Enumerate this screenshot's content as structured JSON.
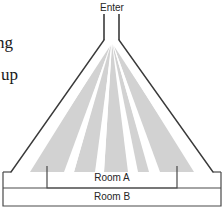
{
  "figure": {
    "type": "evacuation-flow-diagram"
  },
  "labels": {
    "enter": "Enter",
    "room_a": "Room A",
    "room_b": "Room B"
  },
  "body_text": {
    "fragment_1": "ng",
    "fragment_2": "up"
  },
  "colors": {
    "flow_region_fill": "#d2d2d2",
    "wall_line": "#3a3a3a",
    "room_line": "#4a4a4a",
    "path_fill": "#ffffff",
    "text": "#262626",
    "background": "#ffffff"
  },
  "geometry": {
    "apex": {
      "x": 112,
      "y": 40
    },
    "entrance_channel": {
      "left_x": 104,
      "right_x": 119,
      "top_y": 14,
      "bottom_y": 40
    },
    "funnel_left_base": {
      "x": 11,
      "y": 172
    },
    "funnel_right_base": {
      "x": 213,
      "y": 172
    },
    "room_a": {
      "x": 47,
      "y": 166,
      "width": 130,
      "height": 22
    },
    "room_b": {
      "x": 3,
      "y": 172,
      "width": 218,
      "height": 34
    },
    "path_count": 4
  }
}
